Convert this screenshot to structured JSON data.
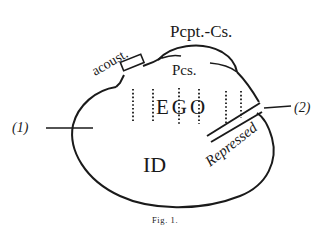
{
  "diagram": {
    "type": "psychic-apparatus-diagram",
    "labels": {
      "pcpt_cs": "Pcpt.-Cs.",
      "acoust": "acoust.",
      "pcs": "Pcs.",
      "ego": "EGO",
      "id": "ID",
      "repressed": "Repressed",
      "marker_1": "(1)",
      "marker_2": "(2)"
    },
    "caption": "Fig. 1.",
    "colors": {
      "ink": "#1a1a1a",
      "background": "#ffffff"
    }
  }
}
